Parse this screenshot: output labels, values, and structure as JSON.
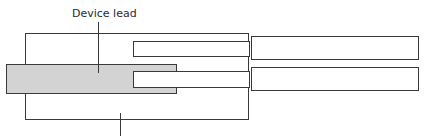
{
  "diagram": {
    "labels": {
      "device_lead": "Device lead"
    },
    "colors": {
      "lead_fill": "#d3d3d3",
      "stroke": "#333333",
      "background": "#ffffff"
    }
  }
}
